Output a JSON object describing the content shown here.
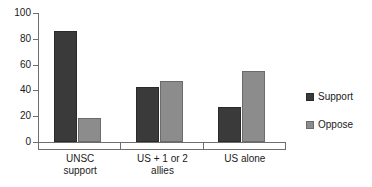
{
  "chart_data": {
    "type": "bar",
    "title": "",
    "subtitle": "",
    "xlabel": "",
    "ylabel": "",
    "ylim": [
      0,
      100
    ],
    "yticks": [
      0,
      20,
      40,
      60,
      80,
      100
    ],
    "ytick_labels": [
      "0",
      "20",
      "40",
      "60",
      "80",
      "100"
    ],
    "grid": false,
    "legend_position": "right",
    "categories": [
      "UNSC support",
      "US + 1 or 2 allies",
      "US alone"
    ],
    "category_lines": [
      [
        "UNSC",
        "support"
      ],
      [
        "US + 1 or 2",
        "allies"
      ],
      [
        "US alone",
        ""
      ]
    ],
    "series": [
      {
        "name": "Support",
        "color": "#3a3a3a",
        "values": [
          86,
          43,
          27
        ]
      },
      {
        "name": "Oppose",
        "color": "#8c8c8c",
        "values": [
          19,
          47,
          55
        ]
      }
    ]
  },
  "legend": {
    "items": [
      {
        "label": "Support",
        "swatch": "support-swatch"
      },
      {
        "label": "Oppose",
        "swatch": "oppose-swatch"
      }
    ]
  }
}
